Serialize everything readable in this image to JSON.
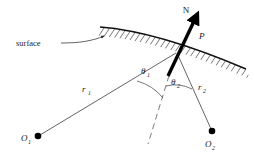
{
  "figure": {
    "background_color": "#ffffff",
    "ink_color": "#1a1a1a",
    "width": 255,
    "height": 159
  },
  "labels": {
    "normal": "N",
    "point": "P",
    "surface": "surface",
    "ray_one": "r",
    "ray_one_sub": "1",
    "ray_two": "r",
    "ray_two_sub": "2",
    "theta_one": "θ",
    "theta_one_sub": "1",
    "theta_two": "θ",
    "theta_two_sub": "2",
    "origin_one": "O",
    "origin_one_sub": "1",
    "origin_two": "O",
    "origin_two_sub": "2"
  },
  "geometry": {
    "point_P": {
      "x": 177,
      "y": 52
    },
    "origin_one_dot": {
      "x": 38,
      "y": 136
    },
    "origin_two_dot": {
      "x": 212,
      "y": 131
    },
    "normal_tip": {
      "x": 198,
      "y": 14
    },
    "normal_tail": {
      "x": 168,
      "y": 76
    },
    "surface_start": {
      "x": 100,
      "y": 27
    },
    "surface_end": {
      "x": 246,
      "y": 69
    },
    "dash_end": {
      "x": 148,
      "y": 144
    }
  },
  "colors": {
    "surface_stroke": "#111111",
    "hatch_stroke": "#2b2b2b",
    "ray_stroke": "#3c3c3c",
    "dash_stroke": "#5a5a5a",
    "normal_stroke": "#000000",
    "dot_fill": "#000000"
  }
}
